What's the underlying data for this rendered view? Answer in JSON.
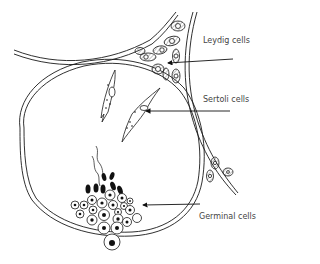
{
  "figure": {
    "labels": {
      "leydig": "Leydig cells",
      "sertoli": "Sertoli cells",
      "germinal": "Germinal cells"
    },
    "colors": {
      "line": "#1a1a1a",
      "text": "#444444",
      "background": "#ffffff"
    }
  }
}
